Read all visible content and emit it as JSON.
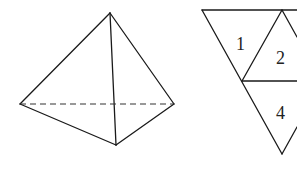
{
  "figure": {
    "tetrahedron": {
      "description": "Triangular pyramid with one hidden (dashed) base edge"
    },
    "net": {
      "description": "Partial net of the tetrahedron made of triangular faces",
      "labels": [
        "1",
        "2",
        "4"
      ]
    }
  },
  "colors": {
    "stroke": "#1a1a1a",
    "background": "#ffffff"
  }
}
